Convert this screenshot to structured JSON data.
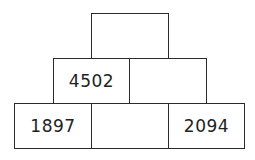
{
  "pyramid": {
    "rows": [
      {
        "cells": [
          {
            "value": ""
          }
        ]
      },
      {
        "cells": [
          {
            "value": "4502"
          },
          {
            "value": ""
          }
        ]
      },
      {
        "cells": [
          {
            "value": "1897"
          },
          {
            "value": ""
          },
          {
            "value": "2094"
          }
        ]
      }
    ]
  }
}
